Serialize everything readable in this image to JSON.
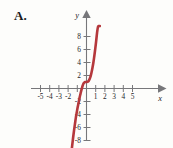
{
  "figure": {
    "panel_label": "A.",
    "background_color": "#fdfdfb"
  },
  "chart_data": {
    "type": "line",
    "title": "",
    "subtitle": "",
    "xlabel": "x",
    "ylabel": "y",
    "xlim": [
      -6.2,
      6.0
    ],
    "ylim": [
      -9.6,
      9.6
    ],
    "grid": false,
    "legend": null,
    "axis_color": "#77777a",
    "curve_color": "#b5383c",
    "curve_width": 2.6,
    "x_tick_labels": [
      "-5",
      "-4",
      "-3",
      "-2",
      "1",
      "2",
      "3",
      "4",
      "5"
    ],
    "x_tick_values": [
      -5,
      -4,
      -3,
      -2,
      1,
      2,
      3,
      4,
      5
    ],
    "x_ticks_all": [
      -5,
      -4,
      -3,
      -2,
      -1,
      1,
      2,
      3,
      4,
      5
    ],
    "y_tick_labels": [
      "8",
      "6",
      "4",
      "2",
      "-2",
      "-4",
      "-6",
      "-8"
    ],
    "y_tick_values": [
      8,
      6,
      4,
      2,
      -2,
      -4,
      -6,
      -8
    ],
    "x_axis_arrow": true,
    "y_axis_arrow": true,
    "series": [
      {
        "name": "cubic",
        "color": "#b5383c",
        "x": [
          -1.62,
          -1.55,
          -1.45,
          -1.35,
          -1.25,
          -1.15,
          -1.05,
          -0.95,
          -0.85,
          -0.75,
          -0.65,
          -0.55,
          -0.45,
          -0.35,
          -0.25,
          -0.15,
          -0.05,
          0.05,
          0.15,
          0.25,
          0.35,
          0.45,
          0.55,
          0.65,
          0.75,
          0.85,
          0.95,
          1.05,
          1.15,
          1.25,
          1.35,
          1.45
        ],
        "y": [
          -9.6,
          -8.7,
          -7.5,
          -6.4,
          -5.4,
          -4.4,
          -3.6,
          -2.8,
          -2.1,
          -1.4,
          -0.8,
          -0.2,
          0.3,
          0.7,
          0.9,
          1.0,
          1.0,
          1.0,
          1.05,
          1.2,
          1.5,
          1.9,
          2.5,
          3.2,
          4.0,
          5.0,
          6.1,
          7.3,
          8.6,
          9.5,
          9.6,
          9.6
        ]
      }
    ]
  }
}
